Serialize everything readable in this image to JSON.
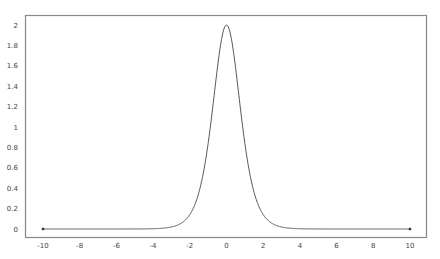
{
  "chart_data": {
    "type": "line",
    "title": "",
    "xlabel": "",
    "ylabel": "",
    "xlim": [
      -11,
      11.4
    ],
    "ylim": [
      -0.09,
      2.09
    ],
    "grid": false,
    "legend": null,
    "x_ticks": [
      "-10",
      "-8",
      "-6",
      "-4",
      "-2",
      "0",
      "2",
      "4",
      "6",
      "8",
      "10"
    ],
    "y_ticks": [
      "0",
      "0.2",
      "0.4",
      "0.6",
      "0.8",
      "1",
      "1.2",
      "1.4",
      "1.6",
      "1.8",
      "2"
    ],
    "series": [
      {
        "name": "f(x)",
        "color": "#555555",
        "endpoint_markers": true,
        "x": [
          -10,
          -8,
          -6,
          -5,
          -4,
          -3.5,
          -3,
          -2.5,
          -2,
          -1.75,
          -1.5,
          -1.25,
          -1,
          -0.75,
          -0.5,
          -0.25,
          0,
          0.25,
          0.5,
          0.75,
          1,
          1.25,
          1.5,
          1.75,
          2,
          2.5,
          3,
          3.5,
          4,
          5,
          6,
          8,
          10
        ],
        "y": [
          0.0,
          0.0,
          0.0,
          0.0002,
          0.0027,
          0.0073,
          0.0197,
          0.053,
          0.1413,
          0.228,
          0.3611,
          0.5527,
          0.8399,
          1.1806,
          1.5729,
          1.8799,
          2.0,
          1.8799,
          1.5729,
          1.1806,
          0.8399,
          0.5527,
          0.3611,
          0.228,
          0.1413,
          0.053,
          0.0197,
          0.0073,
          0.0027,
          0.0002,
          0.0,
          0.0,
          0.0
        ]
      }
    ]
  },
  "colors": {
    "frame": "#888888",
    "line": "#555555",
    "background": "#ffffff"
  }
}
